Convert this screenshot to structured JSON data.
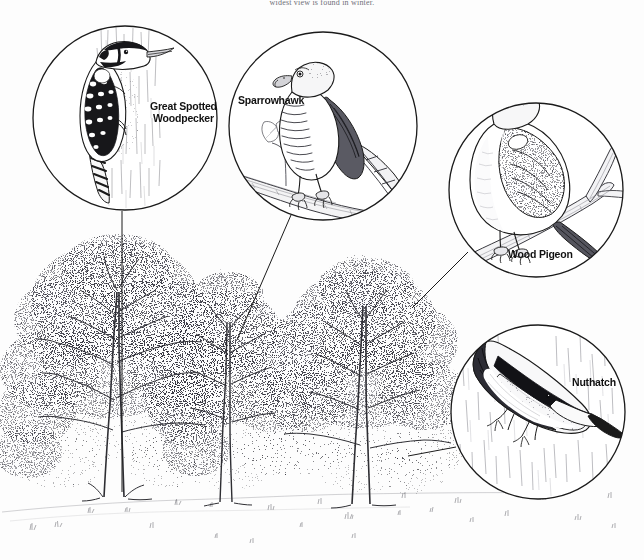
{
  "page": {
    "top_caption": "widest view is found in winter.",
    "background_color": "#fdfdfd",
    "ink_color": "#1a1a1a",
    "width": 644,
    "height": 560
  },
  "scene": {
    "name": "woodland-bird-habitat-diagram",
    "description": "Pen-and-ink illustration of three oak trees with four circular inset close-ups of woodland birds connected by leader lines",
    "ground_label": "grassy-ground",
    "trees": [
      {
        "name": "left-oak-tree",
        "trunk_x": 113,
        "base_y": 500,
        "canopy_top": 245
      },
      {
        "name": "middle-oak-tree",
        "trunk_x": 225,
        "base_y": 503,
        "canopy_top": 272
      },
      {
        "name": "right-oak-tree",
        "trunk_x": 360,
        "base_y": 505,
        "canopy_top": 255
      }
    ]
  },
  "callouts": [
    {
      "id": "great-spotted-woodpecker",
      "label": "Great Spotted\nWoodpecker",
      "circle": {
        "cx": 125,
        "cy": 118,
        "r": 93
      },
      "scene": "woodpecker clinging to a vertical tree trunk",
      "leader": {
        "x1": 122,
        "y1": 211,
        "x2": 122,
        "y2": 492
      }
    },
    {
      "id": "sparrowhawk",
      "label": "Sparrowhawk",
      "circle": {
        "cx": 323,
        "cy": 126,
        "r": 95
      },
      "scene": "sparrowhawk perched on a branch with a twig of leaves",
      "leader": {
        "x1": 291,
        "y1": 215,
        "x2": 237,
        "y2": 340
      }
    },
    {
      "id": "wood-pigeon",
      "label": "Wood Pigeon",
      "circle": {
        "cx": 536,
        "cy": 190,
        "r": 88
      },
      "scene": "wood pigeon perched on a forked branch",
      "leader": {
        "x1": 468,
        "y1": 252,
        "x2": 412,
        "y2": 308
      }
    },
    {
      "id": "nuthatch",
      "label": "Nuthatch",
      "circle": {
        "cx": 538,
        "cy": 412,
        "r": 88
      },
      "scene": "nuthatch climbing head-down on bark",
      "leader": {
        "x1": 456,
        "y1": 447,
        "x2": 408,
        "y2": 456
      }
    }
  ]
}
